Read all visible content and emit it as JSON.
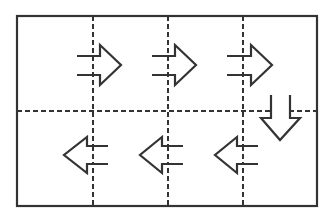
{
  "diagram": {
    "colors": {
      "background": "#ffffff",
      "stroke": "#333333"
    },
    "frame": {
      "x": 17,
      "y": 16,
      "width": 300,
      "height": 190
    },
    "grid": {
      "vertical_dashed_x": [
        93,
        168,
        243
      ],
      "horizontal_dashed_y": 111
    },
    "arrows": [
      {
        "id": "arrow-1",
        "direction": "right",
        "row": 1,
        "offset_x": 0
      },
      {
        "id": "arrow-2",
        "direction": "right",
        "row": 1,
        "offset_x": 75
      },
      {
        "id": "arrow-3",
        "direction": "right",
        "row": 1,
        "offset_x": 150
      },
      {
        "id": "arrow-4",
        "direction": "down",
        "row": "between",
        "offset_x": 0
      },
      {
        "id": "arrow-5",
        "direction": "left",
        "row": 2,
        "offset_x": 150
      },
      {
        "id": "arrow-6",
        "direction": "left",
        "row": 2,
        "offset_x": 75
      },
      {
        "id": "arrow-7",
        "direction": "left",
        "row": 2,
        "offset_x": 0
      }
    ]
  }
}
